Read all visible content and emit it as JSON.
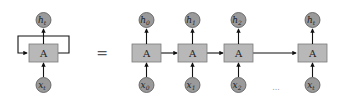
{
  "diagram": {
    "colors": {
      "cell_fill": "#b8b8b8",
      "cell_stroke": "#7a7a7a",
      "node_fill": "#9a9a9a",
      "node_stroke": "#555555",
      "arrow": "#111111"
    },
    "folded": {
      "cell_label": "A",
      "output": {
        "base": "h",
        "sub": "t"
      },
      "input": {
        "base": "x",
        "sub": "t"
      }
    },
    "equals_sign": "=",
    "unrolled": [
      {
        "cell_label": "A",
        "output": {
          "base": "h",
          "sub": "0"
        },
        "input": {
          "base": "x",
          "sub": "0"
        }
      },
      {
        "cell_label": "A",
        "output": {
          "base": "h",
          "sub": "1"
        },
        "input": {
          "base": "x",
          "sub": "1"
        }
      },
      {
        "cell_label": "A",
        "output": {
          "base": "h",
          "sub": "2"
        },
        "input": {
          "base": "x",
          "sub": "2"
        }
      },
      {
        "cell_label": "A",
        "output": {
          "base": "h",
          "sub": "t"
        },
        "input": {
          "base": "x",
          "sub": "t"
        }
      }
    ],
    "ellipsis": "..."
  }
}
